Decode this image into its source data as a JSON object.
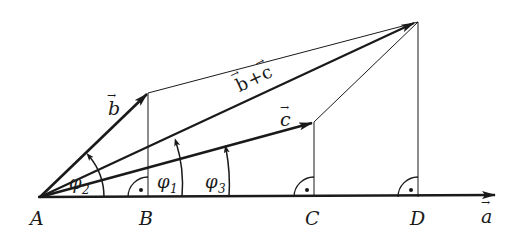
{
  "diagram": {
    "type": "vector-projection",
    "points": {
      "A": {
        "label": "A",
        "x": 40,
        "y": 197
      },
      "B": {
        "label": "B",
        "x": 148,
        "y": 197
      },
      "C": {
        "label": "C",
        "x": 314,
        "y": 197
      },
      "D": {
        "label": "D",
        "x": 418,
        "y": 197
      }
    },
    "vectors": {
      "a": {
        "label": "a",
        "arrow": "→"
      },
      "b": {
        "label": "b",
        "arrow": "→"
      },
      "c": {
        "label": "c",
        "arrow": "→"
      },
      "b_plus_c": {
        "label": "b + c",
        "b": "b",
        "plus": "+",
        "c": "c",
        "arrow": "→"
      }
    },
    "angles": {
      "phi1": {
        "symbol": "φ",
        "sub": "1"
      },
      "phi2": {
        "symbol": "φ",
        "sub": "2"
      },
      "phi3": {
        "symbol": "φ",
        "sub": "3"
      }
    },
    "right_angle_marks": [
      "B",
      "C",
      "D"
    ],
    "colors": {
      "ink": "#1a1a1a",
      "background": "#ffffff"
    }
  }
}
